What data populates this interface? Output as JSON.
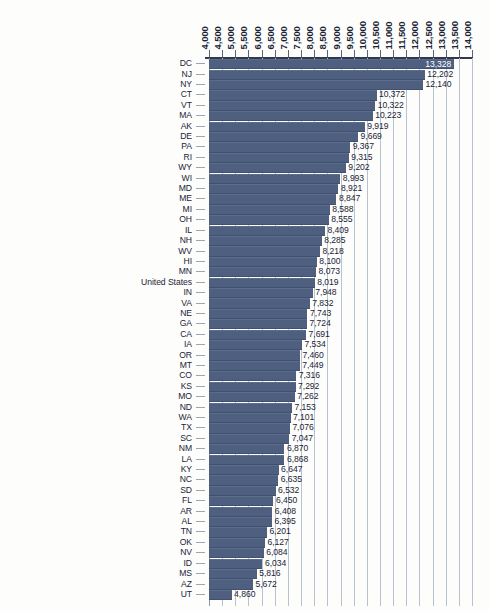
{
  "chart_data": {
    "type": "bar",
    "orientation": "horizontal",
    "title": "",
    "subtitle": "",
    "xlabel": "",
    "ylabel": "",
    "xlim": [
      4000,
      14000
    ],
    "xtick_step": 500,
    "grid": true,
    "legend": false,
    "legend_position": "none",
    "bar_color": "#4e5f80",
    "gridline_color": "#b9c2d0",
    "background_color": "#fdfdfc",
    "value_label_format": "comma-separated integer",
    "xticks": [
      "4,000",
      "4,500",
      "5,000",
      "5,500",
      "6,000",
      "6,500",
      "7,000",
      "7,500",
      "8,000",
      "8,500",
      "9,000",
      "9,500",
      "10,000",
      "10,500",
      "11,000",
      "11,500",
      "12,000",
      "12,500",
      "13,000",
      "13,500",
      "14,000"
    ],
    "xtick_values": [
      4000,
      4500,
      5000,
      5500,
      6000,
      6500,
      7000,
      7500,
      8000,
      8500,
      9000,
      9500,
      10000,
      10500,
      11000,
      11500,
      12000,
      12500,
      13000,
      13500,
      14000
    ],
    "categories": [
      "DC",
      "NJ",
      "NY",
      "CT",
      "VT",
      "MA",
      "AK",
      "DE",
      "PA",
      "RI",
      "WY",
      "WI",
      "MD",
      "ME",
      "MI",
      "OH",
      "IL",
      "NH",
      "WV",
      "HI",
      "MN",
      "United States",
      "IN",
      "VA",
      "NE",
      "GA",
      "CA",
      "IA",
      "OR",
      "MT",
      "CO",
      "KS",
      "MO",
      "ND",
      "WA",
      "TX",
      "SC",
      "NM",
      "LA",
      "KY",
      "NC",
      "SD",
      "FL",
      "AR",
      "AL",
      "TN",
      "OK",
      "NV",
      "ID",
      "MS",
      "AZ",
      "UT"
    ],
    "values": [
      13328,
      12202,
      12140,
      10372,
      10322,
      10223,
      9919,
      9669,
      9367,
      9315,
      9202,
      8993,
      8921,
      8847,
      8588,
      8555,
      8409,
      8285,
      8218,
      8100,
      8073,
      8019,
      7948,
      7832,
      7743,
      7724,
      7691,
      7534,
      7460,
      7449,
      7316,
      7292,
      7262,
      7153,
      7101,
      7076,
      7047,
      6870,
      6868,
      6647,
      6635,
      6532,
      6450,
      6408,
      6395,
      6201,
      6127,
      6084,
      6034,
      5816,
      5672,
      4860
    ],
    "value_labels": [
      "13,328",
      "12,202",
      "12,140",
      "10,372",
      "10,322",
      "10,223",
      "9,919",
      "9,669",
      "9,367",
      "9,315",
      "9,202",
      "8,993",
      "8,921",
      "8,847",
      "8,588",
      "8,555",
      "8,409",
      "8,285",
      "8,218",
      "8,100",
      "8,073",
      "8,019",
      "7,948",
      "7,832",
      "7,743",
      "7,724",
      "7,691",
      "7,534",
      "7,460",
      "7,449",
      "7,316",
      "7,292",
      "7,262",
      "7,153",
      "7,101",
      "7,076",
      "7,047",
      "6,870",
      "6,868",
      "6,647",
      "6,635",
      "6,532",
      "6,450",
      "6,408",
      "6,395",
      "6,201",
      "6,127",
      "6,084",
      "6,034",
      "5,816",
      "5,672",
      "4,860"
    ]
  }
}
